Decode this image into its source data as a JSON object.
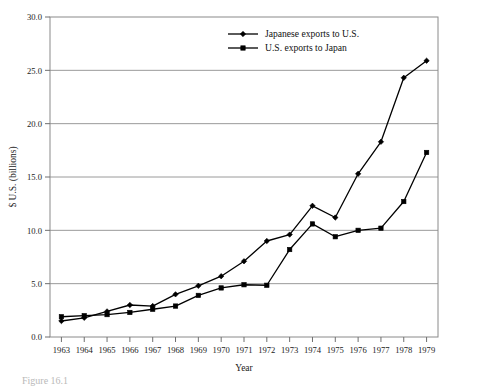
{
  "chart_data": {
    "type": "line",
    "title": "",
    "xlabel": "Year",
    "ylabel": "$ U.S. (billions)",
    "xlim": [
      1963,
      1979
    ],
    "ylim": [
      0.0,
      30.0
    ],
    "yticks": [
      "0.0",
      "5.0",
      "10.0",
      "15.0",
      "20.0",
      "25.0",
      "30.0"
    ],
    "ytick_values": [
      0,
      5,
      10,
      15,
      20,
      25,
      30
    ],
    "grid": "horizontal",
    "legend_position": "top-right",
    "categories": [
      1963,
      1964,
      1965,
      1966,
      1967,
      1968,
      1969,
      1970,
      1971,
      1972,
      1973,
      1974,
      1975,
      1976,
      1977,
      1978,
      1979
    ],
    "xtick_labels": [
      "1963",
      "1964",
      "1965",
      "1966",
      "1967",
      "1968",
      "1969",
      "1970",
      "1971",
      "1972",
      "1973",
      "1974",
      "1975",
      "1976",
      "1977",
      "1978",
      "1979"
    ],
    "series": [
      {
        "name": "Japanese exports to U.S.",
        "marker": "diamond",
        "color": "#000000",
        "values": [
          1.5,
          1.8,
          2.4,
          3.0,
          2.9,
          4.0,
          4.8,
          5.7,
          7.1,
          9.0,
          9.6,
          12.3,
          11.2,
          15.3,
          18.3,
          24.3,
          25.9
        ]
      },
      {
        "name": "U.S. exports to Japan",
        "marker": "square",
        "color": "#000000",
        "values": [
          1.9,
          2.0,
          2.1,
          2.3,
          2.6,
          2.9,
          3.9,
          4.6,
          4.9,
          4.85,
          8.2,
          10.6,
          9.4,
          10.0,
          10.2,
          12.7,
          17.3
        ]
      }
    ]
  },
  "legend": {
    "items": [
      {
        "label": "Japanese exports to U.S.",
        "marker": "diamond"
      },
      {
        "label": "U.S. exports to Japan",
        "marker": "square"
      }
    ]
  },
  "axes": {
    "x_title": "Year",
    "y_title": "$ U.S. (billions)"
  },
  "caption": {
    "text": "Figure 16.1"
  }
}
